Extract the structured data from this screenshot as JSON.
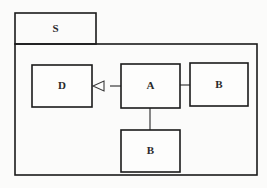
{
  "diagram": {
    "kind": "uml-package-diagram",
    "canvas": {
      "width": 267,
      "height": 188,
      "background": "#fbfbfa"
    },
    "stroke_color": "#1b1b1b",
    "edge_color": "#3a3a3a",
    "package": {
      "name": "S",
      "tab": {
        "x": 15,
        "y": 13,
        "width": 81,
        "height": 31
      },
      "body": {
        "x": 15,
        "y": 44,
        "width": 242,
        "height": 131
      }
    },
    "nodes": [
      {
        "id": "d",
        "label": "D",
        "x": 32,
        "y": 65,
        "width": 60,
        "height": 42
      },
      {
        "id": "a",
        "label": "A",
        "x": 121,
        "y": 64,
        "width": 59,
        "height": 44
      },
      {
        "id": "b_right",
        "label": "B",
        "x": 190,
        "y": 63,
        "width": 58,
        "height": 43
      },
      {
        "id": "b_bottom",
        "label": "B",
        "x": 121,
        "y": 130,
        "width": 59,
        "height": 42
      }
    ],
    "edges": [
      {
        "id": "a-to-d",
        "from": "a",
        "to": "d",
        "type": "generalization",
        "arrowhead": "hollow-triangle",
        "points": "110,86 121,86"
      },
      {
        "id": "a-to-b-right",
        "from": "a",
        "to": "b_right",
        "type": "association",
        "arrowhead": "none",
        "points": "180,85 190,85"
      },
      {
        "id": "a-to-b-bottom",
        "from": "a",
        "to": "b_bottom",
        "type": "association",
        "arrowhead": "none",
        "points": "150,108 150,130"
      }
    ],
    "arrowhead_shape": {
      "id": "hollow-triangle-left",
      "points": "93,86 104,81 104,91"
    }
  }
}
